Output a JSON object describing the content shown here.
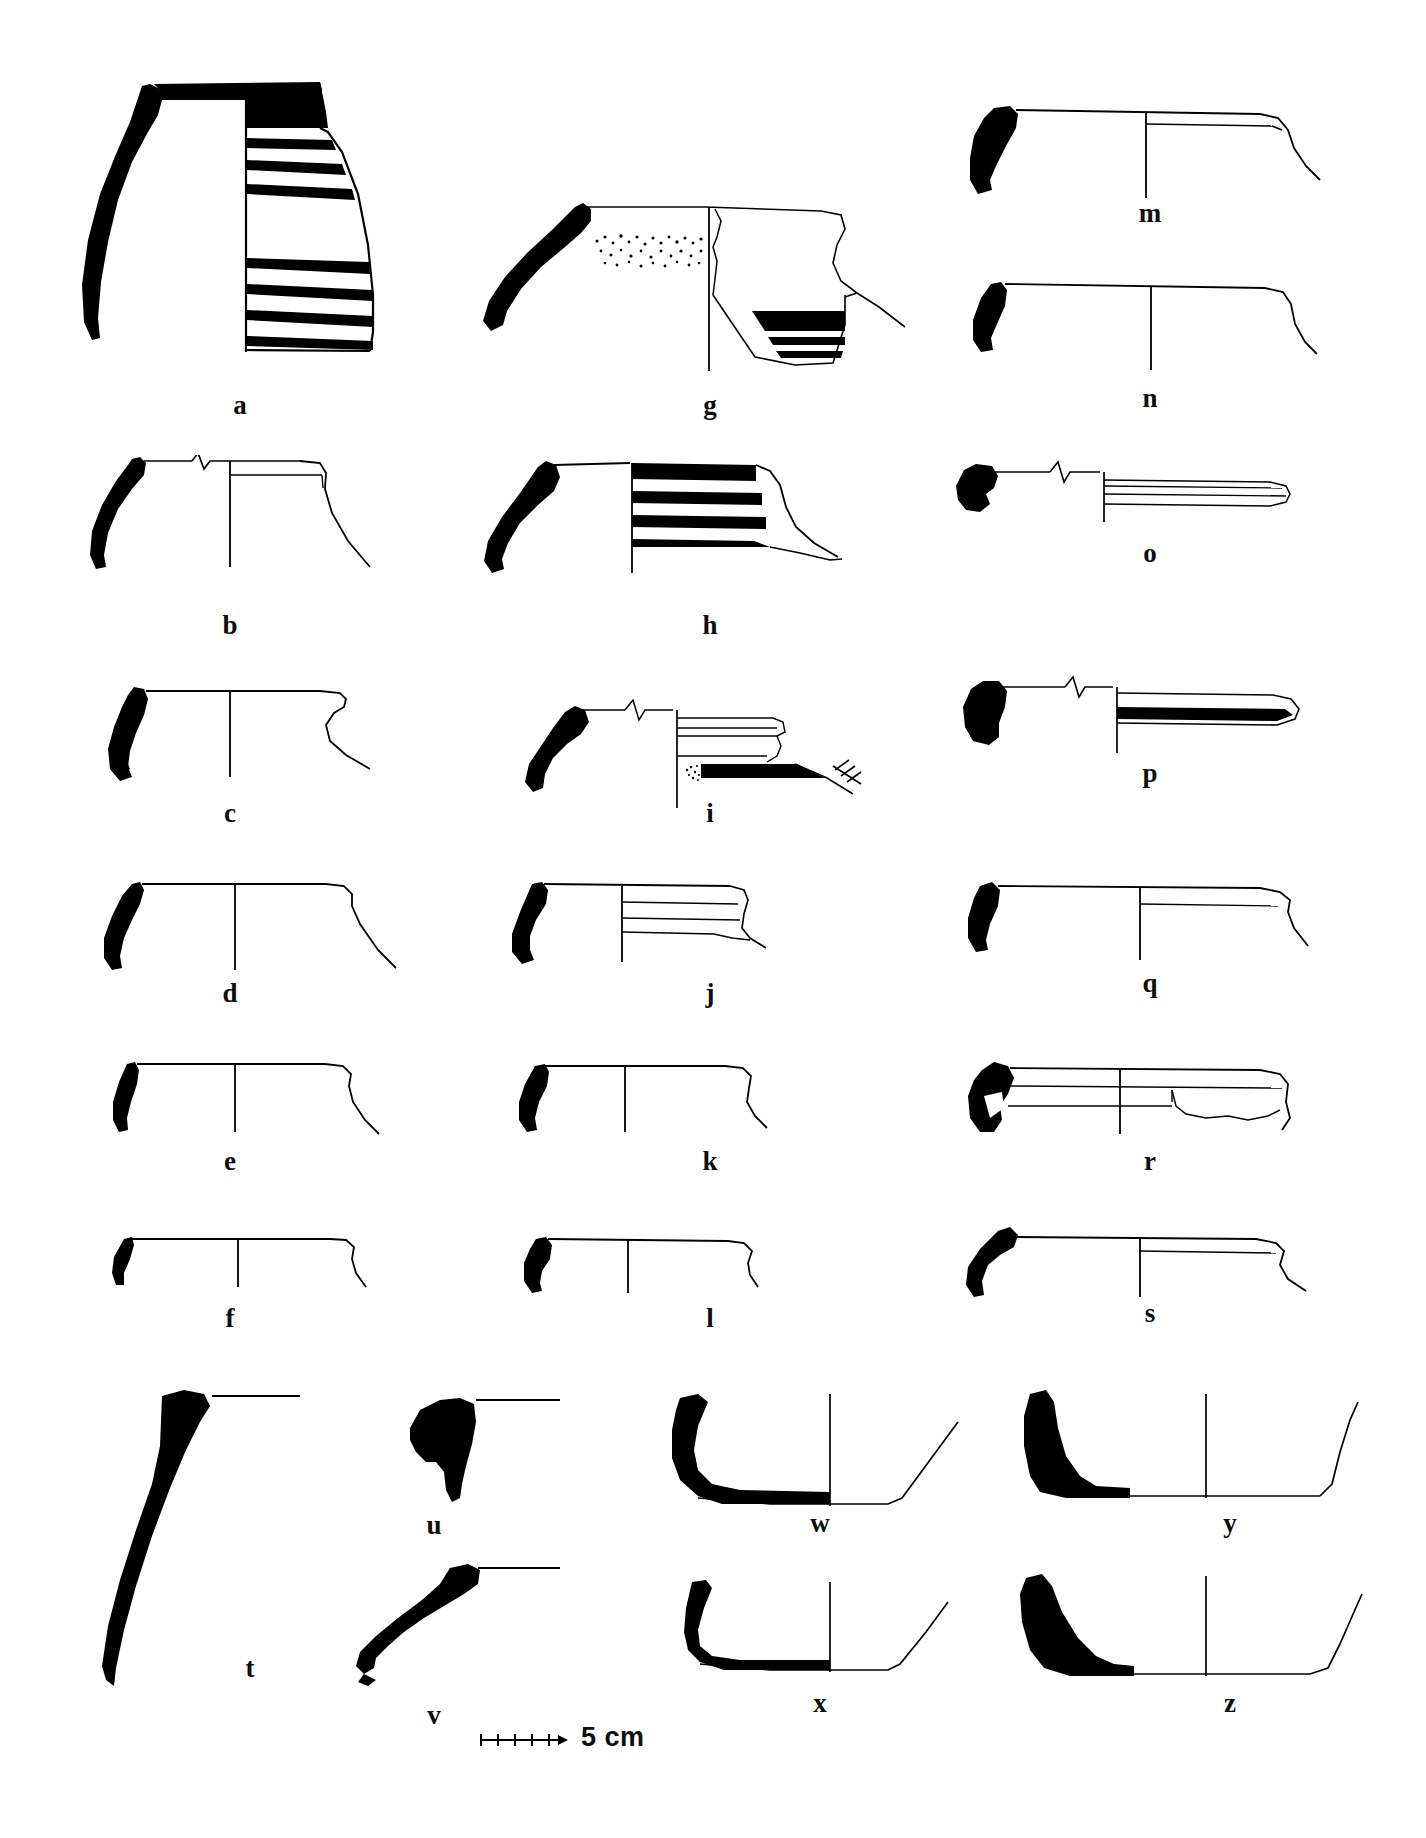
{
  "plate": {
    "type": "archaeological-pottery-drawing-plate",
    "title": "",
    "background_color": "#ffffff",
    "ink_color": "#000000",
    "label_style": "bold serif lowercase letters",
    "columns": 3,
    "figure_count": 26
  },
  "scale_bar": {
    "label": "5 cm",
    "divisions": 5,
    "tick_count": 6,
    "length_px": 84,
    "position": "bottom-center"
  },
  "figures": [
    {
      "id": "a",
      "label": "a",
      "column": 1,
      "row": 1,
      "kind": "complete-profile-jar",
      "description": "Large jar with flaring everted rim, solid black sectioned wall on left, black painted rim band and six horizontal painted bands on body",
      "has_section": true,
      "has_painted_bands": true,
      "band_count": 6,
      "has_stipple": false,
      "has_break_symbol": false
    },
    {
      "id": "b",
      "label": "b",
      "column": 1,
      "row": 2,
      "kind": "rim-profile",
      "description": "Everted rim with short neck, interior line, break symbol on rim line, plain body",
      "has_section": true,
      "has_painted_bands": false,
      "band_count": 0,
      "has_stipple": false,
      "has_break_symbol": true
    },
    {
      "id": "c",
      "label": "c",
      "column": 1,
      "row": 3,
      "kind": "rim-profile",
      "description": "Thick rolled rim with carination, solid black section, plain wall",
      "has_section": true,
      "has_painted_bands": false,
      "band_count": 0,
      "has_stipple": false,
      "has_break_symbol": false
    },
    {
      "id": "d",
      "label": "d",
      "column": 1,
      "row": 4,
      "kind": "rim-profile",
      "description": "Simple everted rim, black section, straight flaring wall",
      "has_section": true,
      "has_painted_bands": false,
      "band_count": 0,
      "has_stipple": false,
      "has_break_symbol": false
    },
    {
      "id": "e",
      "label": "e",
      "column": 1,
      "row": 5,
      "kind": "rim-profile",
      "description": "Small everted rim with slight bead, black section, shallow wall",
      "has_section": true,
      "has_painted_bands": false,
      "band_count": 0,
      "has_stipple": false,
      "has_break_symbol": false
    },
    {
      "id": "f",
      "label": "f",
      "column": 1,
      "row": 6,
      "kind": "rim-profile",
      "description": "Small simple rim, thin black section, shallow open wall",
      "has_section": true,
      "has_painted_bands": false,
      "band_count": 0,
      "has_stipple": false,
      "has_break_symbol": false
    },
    {
      "id": "g",
      "label": "g",
      "column": 2,
      "row": 1,
      "kind": "rim-profile",
      "description": "Everted rim with long neck, stippled surface band below rim, interior painted bands on lower break",
      "has_section": true,
      "has_painted_bands": true,
      "band_count": 3,
      "has_stipple": true,
      "has_break_symbol": false
    },
    {
      "id": "h",
      "label": "h",
      "column": 2,
      "row": 2,
      "kind": "rim-profile",
      "description": "Everted rim, black rim band and three horizontal painted bands on upper wall",
      "has_section": true,
      "has_painted_bands": true,
      "band_count": 4,
      "has_stipple": false,
      "has_break_symbol": false
    },
    {
      "id": "i",
      "label": "i",
      "column": 2,
      "row": 3,
      "kind": "rim-profile",
      "description": "Everted rim, break symbol on rim line, moulded rim interior, black band with stipple, hatched edge marks at right",
      "has_section": true,
      "has_painted_bands": true,
      "band_count": 1,
      "has_stipple": true,
      "has_break_symbol": true,
      "has_hatching": true
    },
    {
      "id": "j",
      "label": "j",
      "column": 2,
      "row": 4,
      "kind": "rim-profile",
      "description": "Small rim with two fine interior lines, black section, flaring wall",
      "has_section": true,
      "has_painted_bands": false,
      "band_count": 0,
      "has_stipple": false,
      "has_break_symbol": false
    },
    {
      "id": "k",
      "label": "k",
      "column": 2,
      "row": 5,
      "kind": "rim-profile",
      "description": "Short thickened rim, black section, slightly curved wall",
      "has_section": true,
      "has_painted_bands": false,
      "band_count": 0,
      "has_stipple": false,
      "has_break_symbol": false
    },
    {
      "id": "l",
      "label": "l",
      "column": 2,
      "row": 6,
      "kind": "rim-profile",
      "description": "Small rim with rounded lip, black section, shallow wall",
      "has_section": true,
      "has_painted_bands": false,
      "band_count": 0,
      "has_stipple": false,
      "has_break_symbol": false
    },
    {
      "id": "m",
      "label": "m",
      "column": 3,
      "row": 1,
      "kind": "rim-profile",
      "description": "Wide shallow open bowl rim, black section, interior line, downturned edge",
      "has_section": true,
      "has_painted_bands": false,
      "band_count": 0,
      "has_stipple": false,
      "has_break_symbol": false
    },
    {
      "id": "n",
      "label": "n",
      "column": 3,
      "row": 2,
      "kind": "rim-profile",
      "description": "Wide shallow rim, small black section, plain profile with downturned edge",
      "has_section": true,
      "has_painted_bands": false,
      "band_count": 0,
      "has_stipple": false,
      "has_break_symbol": false
    },
    {
      "id": "o",
      "label": "o",
      "column": 3,
      "row": 3,
      "kind": "rim-profile",
      "description": "Small hooked rim, break symbol, narrow horizontal interior bands",
      "has_section": true,
      "has_painted_bands": false,
      "band_count": 0,
      "has_stipple": false,
      "has_break_symbol": true
    },
    {
      "id": "p",
      "label": "p",
      "column": 3,
      "row": 4,
      "kind": "rim-profile",
      "description": "Thickened rim, break symbol, single wide black painted band on wall",
      "has_section": true,
      "has_painted_bands": true,
      "band_count": 1,
      "has_stipple": false,
      "has_break_symbol": true
    },
    {
      "id": "q",
      "label": "q",
      "column": 3,
      "row": 5,
      "kind": "rim-profile",
      "description": "Slightly thickened rim, black section, shallow open wall with bead",
      "has_section": true,
      "has_painted_bands": false,
      "band_count": 0,
      "has_stipple": false,
      "has_break_symbol": false
    },
    {
      "id": "r",
      "label": "r",
      "column": 3,
      "row": 6,
      "kind": "rim-profile",
      "description": "Thick incurving rim, black section, irregular eroded interior surface outline",
      "has_section": true,
      "has_painted_bands": false,
      "band_count": 0,
      "has_stipple": false,
      "has_break_symbol": false
    },
    {
      "id": "s",
      "label": "s",
      "column": 3,
      "row": 7,
      "kind": "rim-profile",
      "description": "Hooked everted rim, black section, long shallow wall",
      "has_section": true,
      "has_painted_bands": false,
      "band_count": 0,
      "has_stipple": false,
      "has_break_symbol": false
    },
    {
      "id": "t",
      "label": "t",
      "column": 1,
      "row": 8,
      "kind": "body-sherd-section",
      "description": "Tall curving solid black wall sherd with short horizontal rim line at top",
      "has_section": true,
      "solid_black": true
    },
    {
      "id": "u",
      "label": "u",
      "column": 2,
      "row": 8,
      "kind": "rim-sherd-section",
      "description": "Small thickened solid black rim sherd with horizontal rim line",
      "has_section": true,
      "solid_black": true
    },
    {
      "id": "v",
      "label": "v",
      "column": 2,
      "row": 9,
      "kind": "rim-sherd-section",
      "description": "Solid black everted rim sherd, angled wall, horizontal rim line",
      "has_section": true,
      "solid_black": true
    },
    {
      "id": "w",
      "label": "w",
      "column": 3,
      "row": 8,
      "kind": "base-profile",
      "description": "Rounded base with thick black sectioned wall, flaring sides",
      "has_section": true,
      "solid_black": true
    },
    {
      "id": "x",
      "label": "x",
      "column": 3,
      "row": 9,
      "kind": "base-profile",
      "description": "Thin rounded base with black sectioned wall, flaring sides",
      "has_section": true,
      "solid_black": true
    },
    {
      "id": "y",
      "label": "y",
      "column": 4,
      "row": 8,
      "kind": "base-profile",
      "description": "Flat base with thick tapering black sectioned wall, sharply flaring side",
      "has_section": true,
      "solid_black": true
    },
    {
      "id": "z",
      "label": "z",
      "column": 4,
      "row": 9,
      "kind": "base-profile",
      "description": "Flat base with angled black sectioned wall, curving flaring side",
      "has_section": true,
      "solid_black": true
    }
  ]
}
